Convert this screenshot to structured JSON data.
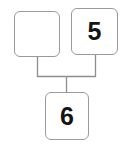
{
  "diagram": {
    "type": "tree-diagram",
    "background_color": "#ffffff",
    "border_color": "#9a9a9a",
    "text_color": "#141414",
    "connector_color": "#8d8d8d",
    "nodes": [
      {
        "id": "left",
        "name": "top-left-node",
        "label": "",
        "position": "top-left",
        "empty": true
      },
      {
        "id": "right",
        "name": "top-right-node",
        "label": "5",
        "position": "top-right",
        "empty": false
      },
      {
        "id": "bottom",
        "name": "bottom-node",
        "label": "6",
        "position": "bottom-center",
        "empty": false
      }
    ],
    "edges": [
      {
        "from": "left",
        "to": "bottom"
      },
      {
        "from": "right",
        "to": "bottom"
      }
    ]
  }
}
